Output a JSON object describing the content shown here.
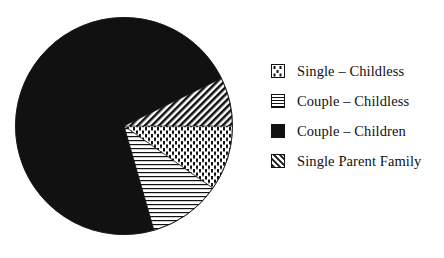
{
  "chart_data": {
    "type": "pie",
    "title": "",
    "categories": [
      "Single – Childless",
      "Couple – Childless",
      "Couple – Children",
      "Single Parent Family"
    ],
    "values": [
      10,
      11,
      72,
      7
    ],
    "unit": "approximate percent (read from slice angles; no data labels shown)",
    "slices": [
      {
        "label": "Single – Childless",
        "value": 10,
        "pattern": "dots",
        "start_deg": 0,
        "end_deg": 35
      },
      {
        "label": "Couple – Childless",
        "value": 11,
        "pattern": "horizontal-lines",
        "start_deg": 35,
        "end_deg": 74
      },
      {
        "label": "Couple – Children",
        "value": 72,
        "pattern": "solid-black",
        "start_deg": 74,
        "end_deg": 334
      },
      {
        "label": "Single Parent Family",
        "value": 7,
        "pattern": "diagonal-hatch",
        "start_deg": 334,
        "end_deg": 360
      }
    ],
    "angle_convention": "degrees clockwise from 3 o'clock",
    "legend_position": "right",
    "grid": false
  },
  "legend": {
    "items": [
      {
        "label": "Single – Childless",
        "pattern": "dots"
      },
      {
        "label": "Couple – Childless",
        "pattern": "horizontal-lines"
      },
      {
        "label": "Couple – Children",
        "pattern": "solid-black"
      },
      {
        "label": "Single Parent Family",
        "pattern": "diagonal-hatch"
      }
    ]
  },
  "colors": {
    "ink": "#111111",
    "background": "#ffffff"
  }
}
